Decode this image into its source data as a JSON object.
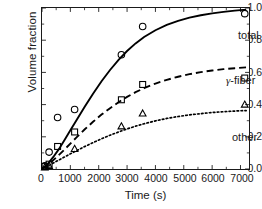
{
  "chart_data": {
    "type": "line",
    "title": "",
    "xlabel": "Time (s)",
    "ylabel": "Volume fraction",
    "xlim": [
      0,
      7300
    ],
    "ylim": [
      0.0,
      1.0
    ],
    "xticks": [
      0,
      1000,
      2000,
      3000,
      4000,
      5000,
      6000,
      7000
    ],
    "xtick_labels": [
      "0",
      "1000",
      "2000",
      "3000",
      "4000",
      "5000",
      "6000",
      "7000"
    ],
    "yticks": [
      0.0,
      0.2,
      0.4,
      0.6,
      0.8,
      1.0
    ],
    "ytick_labels": [
      "0.0",
      "0.2",
      "0.4",
      "0.6",
      "0.8",
      "1.0"
    ],
    "grid": false,
    "legend_position": "inline-annotation",
    "series": [
      {
        "name": "total",
        "marker": "circle",
        "linestyle": "solid",
        "color": "#000000",
        "x": [
          100,
          250,
          550,
          1150,
          2800,
          3550,
          7150
        ],
        "y": [
          0.02,
          0.105,
          0.32,
          0.37,
          0.71,
          0.885,
          0.965
        ],
        "fit_x": [
          0,
          200,
          400,
          600,
          800,
          1000,
          1200,
          1500,
          1800,
          2100,
          2400,
          2700,
          3000,
          3300,
          3600,
          4000,
          4400,
          4800,
          5200,
          5600,
          6000,
          6400,
          6800,
          7200
        ],
        "fit_y": [
          0.0,
          0.03,
          0.075,
          0.125,
          0.182,
          0.24,
          0.298,
          0.385,
          0.468,
          0.545,
          0.615,
          0.678,
          0.733,
          0.78,
          0.82,
          0.862,
          0.895,
          0.92,
          0.94,
          0.955,
          0.967,
          0.976,
          0.984,
          0.99
        ]
      },
      {
        "name": "γ-fiber",
        "marker": "square",
        "linestyle": "dashed",
        "color": "#000000",
        "x": [
          100,
          250,
          550,
          1150,
          2800,
          3550,
          7150
        ],
        "y": [
          0.015,
          0.03,
          0.14,
          0.23,
          0.43,
          0.525,
          0.565
        ],
        "fit_x": [
          0,
          200,
          400,
          600,
          800,
          1000,
          1200,
          1500,
          1800,
          2100,
          2400,
          2700,
          3000,
          3300,
          3600,
          4000,
          4400,
          4800,
          5200,
          5600,
          6000,
          6400,
          6800,
          7200
        ],
        "fit_y": [
          0.0,
          0.025,
          0.055,
          0.088,
          0.122,
          0.158,
          0.193,
          0.245,
          0.293,
          0.338,
          0.378,
          0.415,
          0.448,
          0.477,
          0.502,
          0.531,
          0.554,
          0.573,
          0.589,
          0.602,
          0.612,
          0.62,
          0.626,
          0.631
        ]
      },
      {
        "name": "other",
        "marker": "triangle",
        "linestyle": "dotted",
        "color": "#000000",
        "x": [
          100,
          250,
          1150,
          2800,
          3550,
          7150
        ],
        "y": [
          0.01,
          0.02,
          0.125,
          0.265,
          0.345,
          0.4
        ],
        "fit_x": [
          0,
          200,
          400,
          600,
          800,
          1000,
          1200,
          1500,
          1800,
          2100,
          2400,
          2700,
          3000,
          3300,
          3600,
          4000,
          4400,
          4800,
          5200,
          5600,
          6000,
          6400,
          6800,
          7200
        ],
        "fit_y": [
          0.0,
          0.018,
          0.037,
          0.056,
          0.075,
          0.094,
          0.112,
          0.139,
          0.164,
          0.188,
          0.21,
          0.23,
          0.249,
          0.266,
          0.281,
          0.299,
          0.314,
          0.326,
          0.336,
          0.344,
          0.351,
          0.356,
          0.36,
          0.363
        ]
      }
    ],
    "annotations": [
      {
        "text": "total",
        "x": 5400,
        "y": 0.875
      },
      {
        "text": "γ-fiber",
        "x": 5000,
        "y": 0.6
      },
      {
        "text": "other",
        "x": 5200,
        "y": 0.245
      }
    ]
  }
}
